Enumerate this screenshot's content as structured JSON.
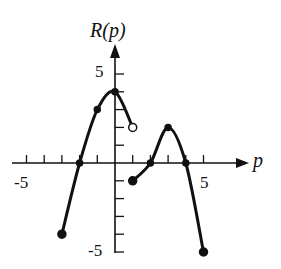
{
  "chart_data": {
    "type": "line",
    "title": "",
    "xlabel": "p",
    "ylabel": "R(p)",
    "xlim": [
      -5.5,
      6
    ],
    "ylim": [
      -5.3,
      6.5
    ],
    "x_tick_labels": [
      "-5",
      "5"
    ],
    "y_tick_labels": [
      "5",
      "-5"
    ],
    "grid": false,
    "series": [
      {
        "name": "left piece",
        "points": [
          [
            -3,
            -4
          ],
          [
            -2,
            0
          ],
          [
            -1,
            3
          ],
          [
            0,
            4
          ],
          [
            1,
            2
          ]
        ],
        "start": {
          "x": -3,
          "y": -4,
          "marker": "closed"
        },
        "end": {
          "x": 1,
          "y": 2,
          "marker": "open"
        },
        "marked_points": [
          [
            -2,
            0
          ],
          [
            -1,
            3
          ],
          [
            0,
            4
          ]
        ]
      },
      {
        "name": "right piece",
        "points": [
          [
            1,
            -1
          ],
          [
            2,
            0
          ],
          [
            3,
            2
          ],
          [
            4,
            0
          ],
          [
            5,
            -5
          ]
        ],
        "start": {
          "x": 1,
          "y": -1,
          "marker": "closed"
        },
        "end": {
          "x": 5,
          "y": -5,
          "marker": "closed"
        },
        "marked_points": [
          [
            2,
            0
          ],
          [
            3,
            2
          ],
          [
            4,
            0
          ]
        ]
      }
    ]
  },
  "labels": {
    "x_axis": "p",
    "y_axis": "R(p)",
    "x_neg": "-5",
    "x_pos": "5",
    "y_pos": "5",
    "y_neg": "-5"
  }
}
